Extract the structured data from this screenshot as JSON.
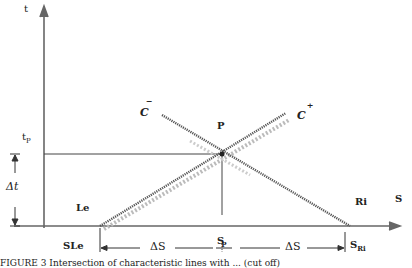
{
  "diagram": {
    "axes": {
      "y_label": "t",
      "x_label": "S",
      "origin": [
        44,
        226
      ]
    },
    "point": {
      "label": "P",
      "t_label": "t",
      "t_sub": "P",
      "s_label": "S",
      "s_sub": "P"
    },
    "characteristics": {
      "minus": {
        "label": "C",
        "sup": "−"
      },
      "plus": {
        "label": "C",
        "sup": "+"
      }
    },
    "boundaries": {
      "left": "Le",
      "right": "Ri",
      "s_left": "SLe",
      "s_right_main": "S",
      "s_right_sub": "Ri"
    },
    "increments": {
      "dt": "Δt",
      "ds_left": "ΔS",
      "ds_right": "ΔS"
    },
    "caption": "FIGURE 3   Intersection of characteristic lines with ... (cut off)"
  },
  "colors": {
    "ink": "#333333",
    "axis": "#666666",
    "dotted": "#bbbbbb"
  }
}
